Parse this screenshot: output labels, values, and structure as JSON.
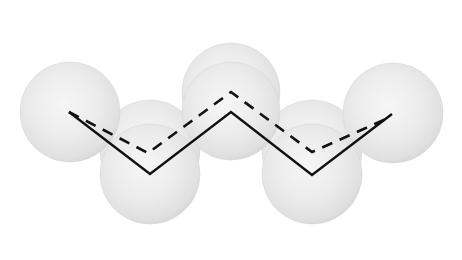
{
  "diagram": {
    "type": "space-filling molecular chain (zigzag)",
    "width": 462,
    "height": 260,
    "colors": {
      "background": "#ffffff",
      "sphere_center": "#f4f4f4",
      "sphere_mid": "#ebebeb",
      "sphere_edge": "#dcdcdc",
      "sphere_rim": "#d2d2d2",
      "bond_line": "#111111"
    },
    "spheres": [
      {
        "id": "sphere-upper-middle-back",
        "cx": 231,
        "cy": 92,
        "r": 49
      },
      {
        "id": "sphere-lower-left-back",
        "cx": 150,
        "cy": 150,
        "r": 50
      },
      {
        "id": "sphere-lower-right-back",
        "cx": 312,
        "cy": 150,
        "r": 50
      },
      {
        "id": "sphere-left-end",
        "cx": 70,
        "cy": 112,
        "r": 50
      },
      {
        "id": "sphere-right-end",
        "cx": 393,
        "cy": 113,
        "r": 50
      },
      {
        "id": "sphere-upper-middle-front",
        "cx": 231,
        "cy": 111,
        "r": 49
      },
      {
        "id": "sphere-lower-left-front",
        "cx": 150,
        "cy": 174,
        "r": 50
      },
      {
        "id": "sphere-lower-right-front",
        "cx": 312,
        "cy": 174,
        "r": 50
      }
    ],
    "solid_chain": {
      "style": "solid",
      "points": [
        [
          69,
          112
        ],
        [
          150,
          174
        ],
        [
          231,
          112
        ],
        [
          312,
          175
        ],
        [
          392,
          114
        ]
      ]
    },
    "dashed_chain": {
      "style": "dashed",
      "points": [
        [
          69,
          112
        ],
        [
          148,
          153
        ],
        [
          231,
          92
        ],
        [
          312,
          152
        ],
        [
          386,
          119
        ]
      ]
    }
  }
}
